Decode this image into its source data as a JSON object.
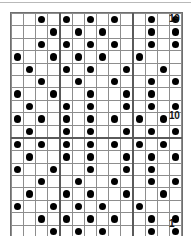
{
  "chart_data": {
    "type": "heatmap",
    "title": "",
    "xlabel": "",
    "ylabel": "",
    "columns": 14,
    "rows": 19,
    "legend": [],
    "grid": true,
    "row_labels_visible": [
      "19",
      "10",
      "1"
    ],
    "colors": {
      "dot": "#000000",
      "grid_line": "#8d8d8d",
      "heavy_line": "#5a5a5a",
      "background": "#ffffff",
      "label_text": "#141414"
    },
    "axis_ranges": {
      "rows": [
        1,
        19
      ],
      "columns": [
        1,
        14
      ]
    },
    "heavy_column_separators": [
      5,
      11
    ],
    "heavy_row_separators": [
      10
    ],
    "cells": [
      [
        0,
        0,
        1,
        0,
        1,
        0,
        1,
        0,
        1,
        0,
        0,
        1,
        0,
        1
      ],
      [
        0,
        0,
        0,
        1,
        0,
        1,
        0,
        1,
        0,
        0,
        0,
        1,
        0,
        1
      ],
      [
        0,
        0,
        1,
        0,
        1,
        0,
        1,
        0,
        1,
        0,
        0,
        1,
        0,
        1
      ],
      [
        1,
        0,
        0,
        1,
        0,
        1,
        0,
        1,
        0,
        0,
        1,
        0,
        0,
        0
      ],
      [
        0,
        1,
        0,
        0,
        1,
        0,
        1,
        0,
        0,
        1,
        0,
        0,
        1,
        0
      ],
      [
        0,
        0,
        1,
        0,
        0,
        1,
        0,
        0,
        1,
        0,
        0,
        1,
        0,
        1
      ],
      [
        1,
        0,
        0,
        1,
        0,
        0,
        1,
        0,
        0,
        1,
        0,
        1,
        0,
        0
      ],
      [
        0,
        1,
        0,
        0,
        1,
        0,
        1,
        0,
        0,
        1,
        0,
        1,
        0,
        1
      ],
      [
        1,
        0,
        1,
        0,
        1,
        0,
        1,
        0,
        1,
        0,
        1,
        0,
        1,
        0
      ],
      [
        0,
        1,
        0,
        0,
        1,
        0,
        1,
        0,
        0,
        1,
        0,
        1,
        0,
        1
      ],
      [
        1,
        0,
        1,
        0,
        1,
        0,
        1,
        0,
        1,
        0,
        1,
        0,
        1,
        0
      ],
      [
        0,
        1,
        0,
        0,
        1,
        0,
        1,
        0,
        0,
        1,
        0,
        1,
        0,
        1
      ],
      [
        1,
        0,
        0,
        1,
        0,
        0,
        1,
        0,
        0,
        1,
        0,
        1,
        0,
        0
      ],
      [
        0,
        0,
        1,
        0,
        0,
        1,
        0,
        0,
        1,
        0,
        0,
        1,
        0,
        1
      ],
      [
        0,
        1,
        0,
        0,
        1,
        0,
        1,
        0,
        0,
        1,
        0,
        0,
        1,
        0
      ],
      [
        1,
        0,
        0,
        1,
        0,
        1,
        0,
        1,
        0,
        0,
        1,
        0,
        0,
        0
      ],
      [
        0,
        0,
        1,
        0,
        1,
        0,
        1,
        0,
        1,
        0,
        0,
        1,
        0,
        1
      ],
      [
        0,
        0,
        0,
        1,
        0,
        1,
        0,
        1,
        0,
        0,
        0,
        1,
        0,
        1
      ],
      [
        0,
        0,
        1,
        0,
        1,
        0,
        1,
        0,
        1,
        0,
        0,
        1,
        0,
        1
      ]
    ]
  },
  "labels": {
    "top": "19",
    "middle": "10",
    "bottom": "1"
  }
}
